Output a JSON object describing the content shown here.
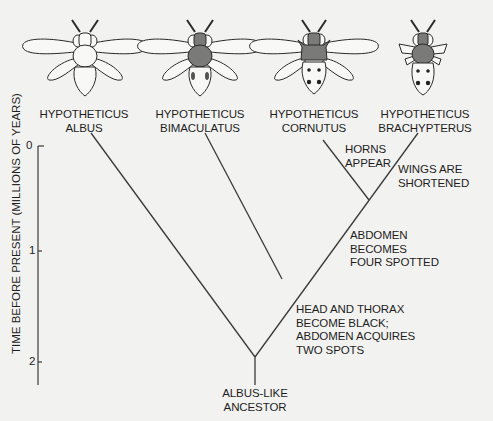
{
  "colors": {
    "background": "#f2f2f0",
    "ink": "#1e1e1e",
    "dark_fill": "#7a7a78"
  },
  "species": [
    {
      "name_line1": "HYPOTHETICUS",
      "name_line2": "ALBUS",
      "icon": "white-insect-icon"
    },
    {
      "name_line1": "HYPOTHETICUS",
      "name_line2": "BIMACULATUS",
      "icon": "two-spotted-insect-icon"
    },
    {
      "name_line1": "HYPOTHETICUS",
      "name_line2": "CORNUTUS",
      "icon": "horned-four-spotted-insect-icon"
    },
    {
      "name_line1": "HYPOTHETICUS",
      "name_line2": "BRACHYPTERUS",
      "icon": "short-winged-four-spotted-insect-icon"
    }
  ],
  "axis": {
    "label": "TIME BEFORE PRESENT (MILLIONS OF YEARS)",
    "ticks": [
      "0",
      "1",
      "2"
    ]
  },
  "annotations": {
    "horns": {
      "line1": "HORNS",
      "line2": "APPEAR"
    },
    "wings": {
      "line1": "WINGS ARE",
      "line2": "SHORTENED"
    },
    "abdomen": {
      "line1": "ABDOMEN",
      "line2": "BECOMES",
      "line3": "FOUR SPOTTED"
    },
    "head": {
      "line1": "HEAD AND THORAX",
      "line2": "BECOME BLACK;",
      "line3": "ABDOMEN ACQUIRES",
      "line4": "TWO SPOTS"
    }
  },
  "root": {
    "line1": "ALBUS-LIKE",
    "line2": "ANCESTOR"
  }
}
